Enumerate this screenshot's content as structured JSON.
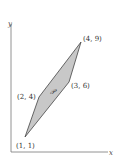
{
  "figure": {
    "axes": {
      "x_label": "x",
      "y_label": "y"
    },
    "region_label": "𝒫",
    "region_fill": "#c8c8c8",
    "vertices": [
      {
        "label": "(1, 1)",
        "x": 1,
        "y": 1
      },
      {
        "label": "(2, 4)",
        "x": 2,
        "y": 4
      },
      {
        "label": "(4, 9)",
        "x": 4,
        "y": 9
      },
      {
        "label": "(3, 6)",
        "x": 3,
        "y": 6
      }
    ]
  }
}
